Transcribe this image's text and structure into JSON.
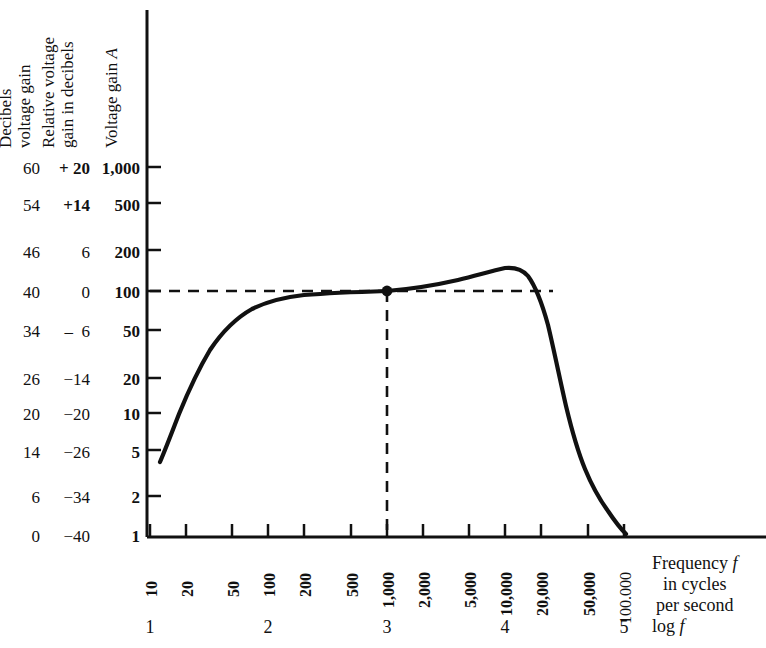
{
  "headers": {
    "col1": [
      "Decibels",
      "voltage gain"
    ],
    "col2": [
      "Relative voltage",
      "gain in decibels"
    ],
    "col3": [
      "Voltage gain A"
    ]
  },
  "y_axis": {
    "decibels_voltage_gain": [
      "60",
      "54",
      "46",
      "40",
      "34",
      "26",
      "20",
      "14",
      "6",
      "0"
    ],
    "relative_voltage_gain_db": [
      "+ 20",
      "+14",
      "6",
      "0",
      "–  6",
      "−14",
      "−20",
      "−26",
      "−34",
      "−40"
    ],
    "voltage_gain": [
      "1,000",
      "500",
      "200",
      "100",
      "50",
      "20",
      "10",
      "5",
      "2",
      "1"
    ]
  },
  "x_axis": {
    "tick_labels": [
      "10",
      "20",
      "50",
      "100",
      "200",
      "500",
      "1,000",
      "2,000",
      "5,000",
      "10,000",
      "20,000",
      "50,000",
      "100.000"
    ],
    "decade_labels": [
      "1",
      "2",
      "3",
      "4",
      "5"
    ],
    "caption": [
      "Frequency f",
      "in cycles",
      "per second"
    ],
    "log_label": "log f"
  },
  "colors": {
    "ink": "#111111",
    "background": "#ffffff"
  },
  "chart_data": {
    "type": "line",
    "title": "",
    "xlabel": "Frequency f in cycles per second",
    "ylabel": "Voltage gain A",
    "xscale": "log",
    "yscale": "log",
    "xlim": [
      10,
      100000
    ],
    "ylim": [
      1,
      1000
    ],
    "grid": false,
    "legend": null,
    "xticks": [
      10,
      20,
      50,
      100,
      200,
      500,
      1000,
      2000,
      5000,
      10000,
      20000,
      50000,
      100000
    ],
    "xticklabels": [
      "10",
      "20",
      "50",
      "100",
      "200",
      "500",
      "1,000",
      "2,000",
      "5,000",
      "10,000",
      "20,000",
      "50,000",
      "100.000"
    ],
    "yticks": [
      1,
      2,
      5,
      10,
      20,
      50,
      100,
      200,
      500,
      1000
    ],
    "yticklabels": [
      "1",
      "2",
      "5",
      "10",
      "20",
      "50",
      "100",
      "200",
      "500",
      "1,000"
    ],
    "secondary_y_axes": [
      {
        "name": "Relative voltage gain in decibels",
        "ticklabels": [
          "+ 20",
          "+14",
          "6",
          "0",
          "–  6",
          "−14",
          "−20",
          "−26",
          "−34",
          "−40"
        ]
      },
      {
        "name": "Decibels voltage gain",
        "ticklabels": [
          "60",
          "54",
          "46",
          "40",
          "34",
          "26",
          "20",
          "14",
          "6",
          "0"
        ]
      }
    ],
    "series": [
      {
        "name": "Amplifier voltage gain response",
        "x": [
          13,
          15,
          18,
          22,
          27,
          33,
          40,
          50,
          62,
          78,
          100,
          140,
          200,
          320,
          500,
          800,
          1000,
          1600,
          2500,
          4000,
          6300,
          9000,
          11000,
          13000,
          15000,
          17000,
          19000,
          21000,
          24000,
          28000,
          33000,
          40000,
          50000,
          63000,
          80000,
          100000
        ],
        "y": [
          4.3,
          6.2,
          10.0,
          16.0,
          26.0,
          38.0,
          52.0,
          64.0,
          72.0,
          78.0,
          81.0,
          84.0,
          86.0,
          88.0,
          90.0,
          95.0,
          100.0,
          108.0,
          118.0,
          130.0,
          143.0,
          150.0,
          151.0,
          146.0,
          132.0,
          110.0,
          86.0,
          64.0,
          43.0,
          27.0,
          17.0,
          10.0,
          5.8,
          3.6,
          2.2,
          1.4
        ]
      }
    ],
    "annotations": [
      {
        "type": "point-marker",
        "x": 1000,
        "y": 100,
        "label": ""
      },
      {
        "type": "dashed-horizontal",
        "y": 100,
        "from_x": 10,
        "to_x": 19000
      },
      {
        "type": "dashed-vertical",
        "x": 1000,
        "from_y": 1,
        "to_y": 100
      }
    ]
  }
}
